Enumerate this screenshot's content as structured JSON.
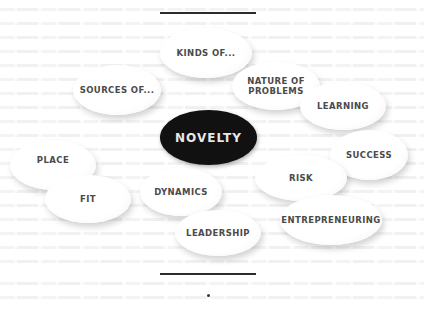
{
  "diagram": {
    "type": "concept-cluster",
    "center": {
      "label": "NOVELTY",
      "fill": "#111111",
      "text_color": "#e8e8e8"
    },
    "nodes": [
      {
        "id": "kinds-of",
        "label": "KINDS OF..."
      },
      {
        "id": "sources-of",
        "label": "SOURCES OF..."
      },
      {
        "id": "nature-of-problems",
        "label": "NATURE OF\nPROBLEMS"
      },
      {
        "id": "learning",
        "label": "LEARNING"
      },
      {
        "id": "success",
        "label": "SUCCESS"
      },
      {
        "id": "place",
        "label": "PLACE"
      },
      {
        "id": "fit",
        "label": "FIT"
      },
      {
        "id": "dynamics",
        "label": "DYNAMICS"
      },
      {
        "id": "risk",
        "label": "RISK"
      },
      {
        "id": "entrepreneuring",
        "label": "ENTREPRENEURING"
      },
      {
        "id": "leadership",
        "label": "LEADERSHIP"
      }
    ],
    "node_fill": "#ffffff",
    "node_text_color": "#4a4a4a",
    "rule_color": "#2b2b2b"
  }
}
